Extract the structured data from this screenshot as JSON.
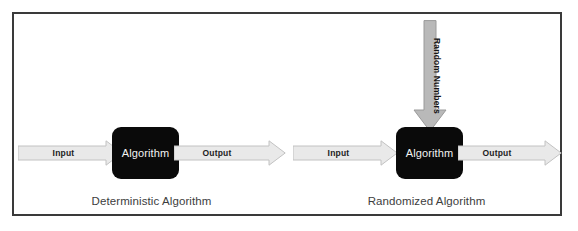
{
  "figure": {
    "background_color": "#ffffff",
    "frame_border_color": "#3a3a3a",
    "arrow_fill_color": "#e9e9e9",
    "arrow_stroke_color": "#c2c2c2",
    "vertical_arrow_fill_color": "#b9b9b9",
    "box_fill_color": "#0a0a0a",
    "box_text_color": "#f2f2f2",
    "caption_color": "#3d3d3d"
  },
  "panels": [
    {
      "id": "deterministic",
      "caption": "Deterministic Algorithm",
      "box_label": "Algorithm",
      "input_label": "Input",
      "output_label": "Output",
      "has_random_input": false,
      "random_label": ""
    },
    {
      "id": "randomized",
      "caption": "Randomized Algorithm",
      "box_label": "Algorithm",
      "input_label": "Input",
      "output_label": "Output",
      "has_random_input": true,
      "random_label": "Random Numbers"
    }
  ]
}
